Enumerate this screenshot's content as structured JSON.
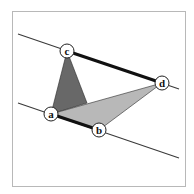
{
  "diagram": {
    "type": "geometry",
    "frame": {
      "x": 12,
      "y": 11,
      "width": 173,
      "height": 175
    },
    "colors": {
      "dark_fill": "#686868",
      "light_fill": "#b8b8b8",
      "thick_edge": "#111111",
      "thin_line": "#3a3a3a",
      "frame": "#b8b8b8"
    },
    "points": {
      "a": {
        "label": "a",
        "x": 51,
        "y": 114
      },
      "b": {
        "label": "b",
        "x": 99,
        "y": 130
      },
      "c": {
        "label": "c",
        "x": 67,
        "y": 51
      },
      "d": {
        "label": "d",
        "x": 162,
        "y": 83
      }
    },
    "parallel_lines": [
      {
        "name": "upper-line",
        "from": [
          18,
          34
        ],
        "to": [
          179,
          89
        ]
      },
      {
        "name": "lower-line",
        "from": [
          18,
          103
        ],
        "to": [
          179,
          158
        ]
      }
    ],
    "thick_edges": [
      {
        "name": "edge-c-d",
        "from": "c",
        "to": "d"
      },
      {
        "name": "edge-a-b",
        "from": "a",
        "to": "b"
      }
    ],
    "triangles": [
      {
        "name": "dark-triangle",
        "vertices": [
          "c",
          "a",
          "p"
        ],
        "extra_point": {
          "p": [
            87,
            103
          ]
        },
        "fill": "dark"
      },
      {
        "name": "light-triangle",
        "vertices": [
          "a",
          "b",
          "d"
        ],
        "fill": "light"
      }
    ]
  }
}
